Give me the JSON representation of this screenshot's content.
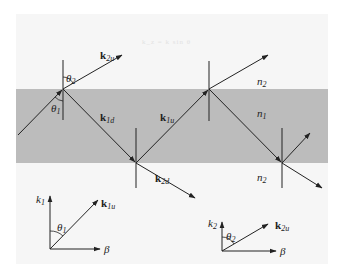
{
  "figure": {
    "colors": {
      "medium1_band": "#bcbcbc",
      "background": "#f6f6f6",
      "ink": "#222222"
    },
    "faint_text": "k_z = k sin θ",
    "media": {
      "upper_top": "n",
      "upper_top_sub": "2",
      "core": "n",
      "core_sub": "1",
      "lower": "n",
      "lower_sub": "2"
    },
    "wave_vectors": {
      "k2u": {
        "base": "k",
        "sub": "2u"
      },
      "k1d": {
        "base": "k",
        "sub": "1d"
      },
      "k1u": {
        "base": "k",
        "sub": "1u"
      },
      "k2d": {
        "base": "k",
        "sub": "2d"
      }
    },
    "angles": {
      "theta1": {
        "base": "θ",
        "sub": "1"
      },
      "theta2": {
        "base": "θ",
        "sub": "2"
      }
    },
    "inset_left": {
      "y_axis": {
        "base": "k",
        "sub": "1"
      },
      "x_axis": "β",
      "vector": {
        "base": "k",
        "sub": "1u"
      },
      "angle": {
        "base": "θ",
        "sub": "1"
      }
    },
    "inset_right": {
      "y_axis": {
        "base": "k",
        "sub": "2"
      },
      "x_axis": "β",
      "vector": {
        "base": "k",
        "sub": "2u"
      },
      "angle": {
        "base": "θ",
        "sub": "2"
      }
    }
  }
}
